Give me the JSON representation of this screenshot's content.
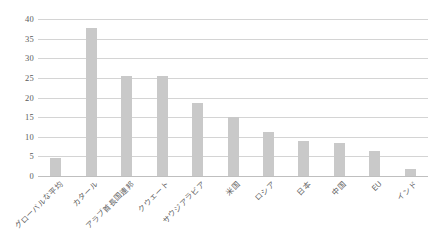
{
  "chart_data": {
    "type": "bar",
    "title": "",
    "subtitle": "",
    "xlabel": "",
    "ylabel": "",
    "ylim": [
      0,
      40
    ],
    "ytick_step": 5,
    "yticks": [
      "40",
      "35",
      "30",
      "25",
      "20",
      "15",
      "10",
      "5",
      "0"
    ],
    "grid": true,
    "legend": "none",
    "bar_color": "#c9c9c9",
    "gridline_color": "#d4d4d4",
    "categories": [
      "グローバルな平均",
      "カタール",
      "アラブ首長国連邦",
      "クウェート",
      "サウジアラビア",
      "米国",
      "ロシア",
      "日本",
      "中国",
      "EU",
      "インド"
    ],
    "values": [
      4.7,
      37.6,
      25.6,
      25.5,
      18.6,
      15.0,
      11.2,
      9.0,
      8.4,
      6.3,
      1.9
    ]
  }
}
